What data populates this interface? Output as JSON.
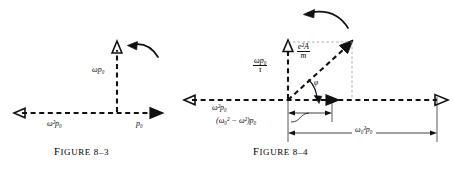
{
  "page": {
    "background": "#ffffff",
    "ink": "#111111",
    "width": 453,
    "height": 169
  },
  "figures": [
    {
      "id": "figure-8-3",
      "caption": "Figure 8–3",
      "caption_small_caps_head": "F",
      "labels": {
        "vertical_axis": "ωp₀",
        "left_axis": "ω²p₀",
        "right_axis": "p₀"
      },
      "arc_arrow": "counterclockwise-rotation-arc"
    },
    {
      "id": "figure-8-4",
      "caption": "Figure 8–4",
      "labels": {
        "vertical_component_num": "ωp₀",
        "vertical_component_den": "τ",
        "resultant_num": "e²A",
        "resultant_den": "m",
        "phase_angle": "φ",
        "left_axis": "ω²p₀",
        "horizontal_component": "(ω₀² − ω²)p₀",
        "total_span": "ω₀²p₀"
      },
      "arc_arrow": "counterclockwise-rotation-arc"
    }
  ]
}
